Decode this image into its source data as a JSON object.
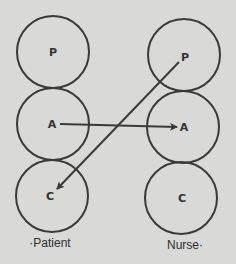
{
  "diagram": {
    "title": "",
    "columns": [
      {
        "id": "patient",
        "label": "·Patient",
        "circles": [
          {
            "letter": "P"
          },
          {
            "letter": "A"
          },
          {
            "letter": "C"
          }
        ]
      },
      {
        "id": "nurse",
        "label": "Nurse·",
        "circles": [
          {
            "letter": "P"
          },
          {
            "letter": "A"
          },
          {
            "letter": "C"
          }
        ]
      }
    ],
    "arrows": [
      {
        "from": "patient.A",
        "to": "nurse.A",
        "description": "Adult to Adult"
      },
      {
        "from": "nurse.P",
        "to": "patient.C",
        "description": "Parent to Child"
      }
    ],
    "colors": {
      "background": "#d9d9d7",
      "stroke": "#3a3a3a",
      "text": "#333333"
    }
  }
}
